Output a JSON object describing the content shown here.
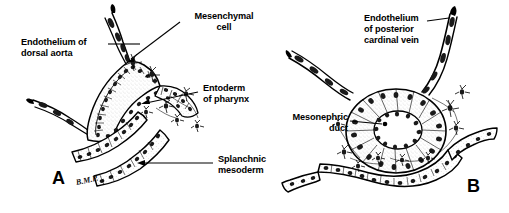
{
  "figure": {
    "background_color": "#ffffff",
    "ink_color": "#000000",
    "width": 509,
    "height": 213
  },
  "panels": [
    {
      "letter": "A",
      "letter_x": 52,
      "letter_y": 172,
      "signature": "B.M.P.",
      "signature_x": 77,
      "signature_y": 186
    },
    {
      "letter": "B",
      "letter_x": 467,
      "letter_y": 180,
      "signature": "",
      "signature_x": 0,
      "signature_y": 0
    }
  ],
  "labels": [
    {
      "id": "endothelium-dorsal-aorta",
      "lines": [
        "Endothelium of",
        "dorsal aorta"
      ],
      "align": "left",
      "x": 21,
      "y": 38,
      "leader": {
        "x1": 108,
        "y1": 44,
        "x2": 140,
        "y2": 44
      }
    },
    {
      "id": "mesenchymal-cell",
      "lines": [
        "Mesenchymal",
        "cell"
      ],
      "align": "center",
      "x": 183,
      "y": 12,
      "leader": {
        "x1": 180,
        "y1": 22,
        "x2": 127,
        "y2": 62
      }
    },
    {
      "id": "entoderm-of-pharynx",
      "lines": [
        "Entoderm",
        "of pharynx"
      ],
      "align": "left",
      "x": 201,
      "y": 84,
      "leader": {
        "x1": 198,
        "y1": 92,
        "x2": 141,
        "y2": 104
      }
    },
    {
      "id": "splanchnic-mesoderm",
      "lines": [
        "Splanchnic",
        "mesoderm"
      ],
      "align": "left",
      "x": 216,
      "y": 155,
      "leader": {
        "x1": 213,
        "y1": 163,
        "x2": 137,
        "y2": 163
      }
    },
    {
      "id": "endothelium-posterior-cardinal-vein",
      "lines": [
        "Endothelium",
        "of posterior",
        "cardinal vein"
      ],
      "align": "left",
      "x": 364,
      "y": 14,
      "leader": {
        "x1": 427,
        "y1": 21,
        "x2": 448,
        "y2": 19
      }
    },
    {
      "id": "mesonephric-duct",
      "lines": [
        "Mesonephric",
        "duct"
      ],
      "align": "right",
      "x": 289,
      "y": 113,
      "leader": {
        "x1": 350,
        "y1": 121,
        "x2": 385,
        "y2": 124
      }
    }
  ]
}
